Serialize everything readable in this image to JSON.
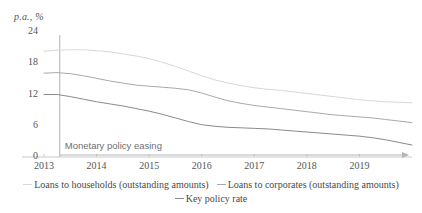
{
  "chart_data": {
    "type": "line",
    "title": "",
    "subtitle": "",
    "unit_label": "p.a., %",
    "xlabel": "",
    "ylabel": "",
    "ylim": [
      0,
      24
    ],
    "yticks": [
      "0",
      "6",
      "12",
      "18",
      "24"
    ],
    "xlim": [
      2013.0,
      2020.0
    ],
    "xticks": [
      "2013",
      "2014",
      "2015",
      "2016",
      "2017",
      "2018",
      "2019"
    ],
    "grid": false,
    "legend_position": "bottom",
    "x": [
      2013.0,
      2013.25,
      2013.5,
      2013.75,
      2014.0,
      2014.25,
      2014.5,
      2014.75,
      2015.0,
      2015.25,
      2015.5,
      2015.75,
      2016.0,
      2016.25,
      2016.5,
      2016.75,
      2017.0,
      2017.25,
      2017.5,
      2017.75,
      2018.0,
      2018.25,
      2018.5,
      2018.75,
      2019.0,
      2019.25,
      2019.5,
      2019.75,
      2020.0
    ],
    "series": [
      {
        "name": "Loans to households (outstanding amounts)",
        "color": "#d8d8d8",
        "values": [
          20.3,
          20.5,
          20.6,
          20.6,
          20.4,
          20.2,
          19.8,
          19.4,
          18.9,
          18.2,
          17.4,
          16.5,
          15.6,
          14.8,
          14.2,
          13.7,
          13.3,
          13.0,
          12.8,
          12.5,
          12.2,
          11.9,
          11.6,
          11.3,
          11.0,
          10.8,
          10.6,
          10.5,
          10.4
        ]
      },
      {
        "name": "Loans to corporates (outstanding amounts)",
        "color": "#a9a9a9",
        "values": [
          16.1,
          16.2,
          16.0,
          15.6,
          15.1,
          14.6,
          14.2,
          13.8,
          13.6,
          13.4,
          13.2,
          12.9,
          12.3,
          11.5,
          10.8,
          10.3,
          9.9,
          9.6,
          9.3,
          9.0,
          8.7,
          8.4,
          8.1,
          7.9,
          7.7,
          7.5,
          7.2,
          6.9,
          6.6
        ]
      },
      {
        "name": "Key policy rate",
        "color": "#8a8a8a",
        "values": [
          12.0,
          12.0,
          11.6,
          11.1,
          10.6,
          10.2,
          9.8,
          9.3,
          8.8,
          8.2,
          7.5,
          6.8,
          6.2,
          5.9,
          5.7,
          5.6,
          5.5,
          5.4,
          5.2,
          5.0,
          4.8,
          4.6,
          4.4,
          4.2,
          4.0,
          3.7,
          3.3,
          2.8,
          2.3
        ]
      }
    ],
    "annotations": [
      {
        "name": "monetary-policy-easing",
        "text": "Monetary policy easing",
        "x": 2013.3,
        "y": 1.2
      }
    ]
  },
  "legend": {
    "rows": [
      [
        {
          "label": "Loans to households (outstanding amounts)",
          "color": "#d8d8d8"
        },
        {
          "label": "Loans to corporates (outstanding amounts)",
          "color": "#a9a9a9"
        }
      ],
      [
        {
          "label": "Key policy rate",
          "color": "#8a8a8a"
        }
      ]
    ]
  }
}
